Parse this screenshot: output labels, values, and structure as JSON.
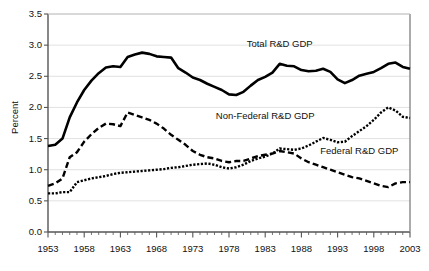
{
  "chart_data": {
    "type": "line",
    "title": "",
    "xlabel": "",
    "ylabel": "Percent",
    "xlim": [
      1953,
      2003
    ],
    "ylim": [
      0.0,
      3.5
    ],
    "grid": true,
    "legend_position": "inline-annotations",
    "y_ticks": [
      "0.0",
      "0.5",
      "1.0",
      "1.5",
      "2.0",
      "2.5",
      "3.0",
      "3.5"
    ],
    "y_tick_values": [
      0.0,
      0.5,
      1.0,
      1.5,
      2.0,
      2.5,
      3.0,
      3.5
    ],
    "x_ticks": [
      "1953",
      "1958",
      "1963",
      "1968",
      "1973",
      "1978",
      "1983",
      "1988",
      "1993",
      "1998",
      "2003"
    ],
    "x_tick_values": [
      1953,
      1958,
      1963,
      1968,
      1973,
      1978,
      1983,
      1988,
      1993,
      1998,
      2003
    ],
    "x_minor_tick_interval": 1,
    "x": [
      1953,
      1954,
      1955,
      1956,
      1957,
      1958,
      1959,
      1960,
      1961,
      1962,
      1963,
      1964,
      1965,
      1966,
      1967,
      1968,
      1969,
      1970,
      1971,
      1972,
      1973,
      1974,
      1975,
      1976,
      1977,
      1978,
      1979,
      1980,
      1981,
      1982,
      1983,
      1984,
      1985,
      1986,
      1987,
      1988,
      1989,
      1990,
      1991,
      1992,
      1993,
      1994,
      1995,
      1996,
      1997,
      1998,
      1999,
      2000,
      2001,
      2002,
      2003
    ],
    "series": [
      {
        "name": "Total R&D GDP",
        "style": "solid",
        "color": "#000000",
        "values": [
          1.38,
          1.4,
          1.5,
          1.84,
          2.08,
          2.28,
          2.43,
          2.55,
          2.64,
          2.66,
          2.65,
          2.81,
          2.85,
          2.88,
          2.86,
          2.82,
          2.81,
          2.8,
          2.63,
          2.56,
          2.48,
          2.44,
          2.38,
          2.33,
          2.28,
          2.21,
          2.2,
          2.25,
          2.35,
          2.44,
          2.49,
          2.56,
          2.7,
          2.67,
          2.66,
          2.6,
          2.58,
          2.59,
          2.62,
          2.57,
          2.45,
          2.39,
          2.44,
          2.51,
          2.54,
          2.57,
          2.63,
          2.7,
          2.72,
          2.65,
          2.62
        ]
      },
      {
        "name": "Non-Federal R&D GDP",
        "style": "dotted",
        "color": "#000000",
        "values": [
          0.62,
          0.62,
          0.64,
          0.64,
          0.8,
          0.83,
          0.86,
          0.88,
          0.9,
          0.93,
          0.95,
          0.96,
          0.97,
          0.98,
          0.99,
          1.0,
          1.01,
          1.03,
          1.04,
          1.06,
          1.08,
          1.09,
          1.1,
          1.08,
          1.04,
          1.02,
          1.04,
          1.08,
          1.14,
          1.18,
          1.21,
          1.26,
          1.34,
          1.33,
          1.32,
          1.34,
          1.39,
          1.45,
          1.51,
          1.48,
          1.44,
          1.45,
          1.54,
          1.62,
          1.7,
          1.8,
          1.92,
          2.0,
          1.95,
          1.85,
          1.83
        ]
      },
      {
        "name": "Federal R&D GDP",
        "style": "dashed",
        "color": "#000000",
        "values": [
          0.74,
          0.78,
          0.86,
          1.2,
          1.28,
          1.45,
          1.57,
          1.67,
          1.74,
          1.73,
          1.7,
          1.92,
          1.88,
          1.84,
          1.8,
          1.74,
          1.66,
          1.56,
          1.48,
          1.4,
          1.3,
          1.24,
          1.2,
          1.18,
          1.14,
          1.12,
          1.14,
          1.14,
          1.18,
          1.22,
          1.24,
          1.26,
          1.3,
          1.28,
          1.26,
          1.18,
          1.12,
          1.08,
          1.04,
          1.0,
          0.96,
          0.92,
          0.88,
          0.86,
          0.82,
          0.78,
          0.74,
          0.72,
          0.78,
          0.8,
          0.8
        ]
      }
    ],
    "annotations": [
      {
        "text": "Total R&D GDP",
        "x": 1985,
        "y": 3.02
      },
      {
        "text": "Non-Federal R&D GDP",
        "x": 1983,
        "y": 1.87
      },
      {
        "text": "Federal R&D GDP",
        "x": 1996,
        "y": 1.3
      }
    ]
  },
  "axes": {
    "ylabel": "Percent"
  }
}
